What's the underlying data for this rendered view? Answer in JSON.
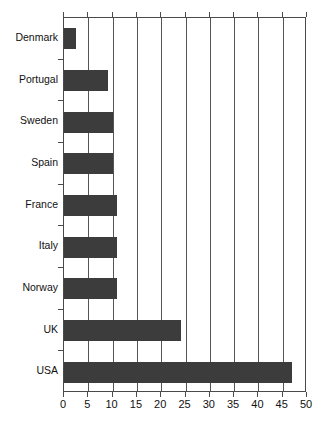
{
  "chart_data": {
    "type": "bar",
    "orientation": "horizontal",
    "title": "",
    "subtitle": "",
    "xlabel": "",
    "ylabel": "",
    "categories": [
      "Denmark",
      "Portugal",
      "Sweden",
      "Spain",
      "France",
      "Italy",
      "Norway",
      "UK",
      "USA"
    ],
    "values": [
      2.5,
      9,
      10,
      10,
      11,
      11,
      11,
      24,
      47
    ],
    "series": [
      {
        "name": "",
        "values": [
          2.5,
          9,
          10,
          10,
          11,
          11,
          11,
          24,
          47
        ]
      }
    ],
    "xlim": [
      0,
      50
    ],
    "xticks": [
      0,
      5,
      10,
      15,
      20,
      25,
      30,
      35,
      40,
      45,
      50
    ],
    "xtick_labels": [
      "0",
      "5",
      "10",
      "15",
      "20",
      "25",
      "30",
      "35",
      "40",
      "45",
      "50"
    ],
    "grid": "vertical",
    "legend": null,
    "legend_position": "none",
    "annotations": [],
    "colors": {
      "bar_fill": "#3c3c3c",
      "grid": "#555555",
      "axis": "#4a4a4a",
      "background": "#ffffff",
      "text": "#111111"
    }
  }
}
